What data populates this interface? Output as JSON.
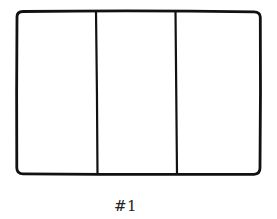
{
  "diagram": {
    "type": "panel-layout-sketch",
    "stroke_color": "#111111",
    "background_color": "#ffffff",
    "frame": {
      "x": 17,
      "y": 11,
      "width": 243,
      "height": 163,
      "corner_radius": 6,
      "stroke_width": 2.8
    },
    "dividers": [
      {
        "x_top": 96,
        "x_bottom": 97.5,
        "stroke_width": 2.2
      },
      {
        "x_top": 175.5,
        "x_bottom": 177,
        "stroke_width": 2.2
      }
    ],
    "panels": [
      {
        "index": 1,
        "label": ""
      },
      {
        "index": 2,
        "label": ""
      },
      {
        "index": 3,
        "label": ""
      }
    ],
    "panel_count": 3,
    "caption": "#1"
  }
}
